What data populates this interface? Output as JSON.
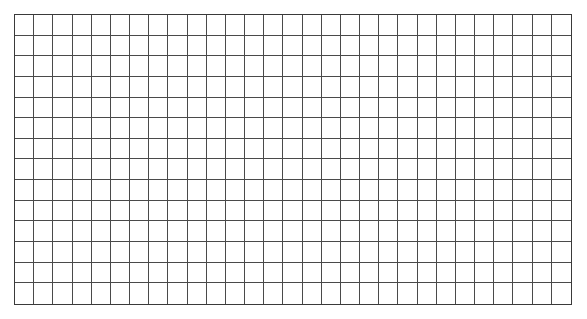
{
  "grid": {
    "columns": 29,
    "rows": 14,
    "line_color": "#4a4a4a",
    "border_color": "#3a3a3a",
    "background": "#ffffff"
  }
}
